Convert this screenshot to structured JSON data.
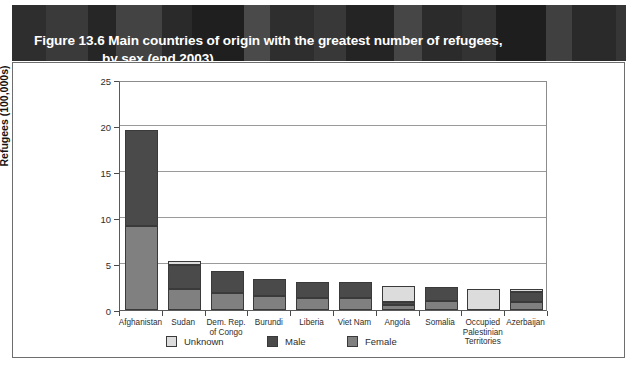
{
  "header": {
    "title_line1": "Figure 13.6 Main countries of origin with the greatest number of refugees,",
    "title_line2": "by sex (end 2003)",
    "band_color": "#2b2b2b"
  },
  "colors": {
    "unknown": "#dcdcdc",
    "male": "#4a4a4a",
    "female": "#808080",
    "gridline": "#9a9a9a",
    "axis": "#5a5a5a",
    "frame": "#6e6e6e"
  },
  "legend": {
    "position": "bottom",
    "items": [
      {
        "label": "Unknown",
        "color": "#dcdcdc"
      },
      {
        "label": "Male",
        "color": "#4a4a4a"
      },
      {
        "label": "Female",
        "color": "#808080"
      }
    ]
  },
  "chart_data": {
    "type": "bar",
    "subtype": "stacked",
    "title": "Figure 13.6 Main countries of origin with the greatest number of refugees, by sex (end 2003)",
    "xlabel": "",
    "ylabel": "Refugees (100,000s)",
    "ylim": [
      0,
      25
    ],
    "yticks": [
      0,
      5,
      10,
      15,
      20,
      25
    ],
    "ytick_labels": [
      "0",
      "5",
      "10",
      "15",
      "20",
      "25"
    ],
    "grid": true,
    "grid_axis": "y",
    "categories": [
      "Afghanistan",
      "Sudan",
      "Dem. Rep.\nof Congo",
      "Burundi",
      "Liberia",
      "Viet Nam",
      "Angola",
      "Somalia",
      "Occupied\nPalestinian\nTerritories",
      "Azerbaijan"
    ],
    "series": [
      {
        "name": "Female",
        "color": "#808080",
        "values": [
          9.1,
          2.3,
          1.8,
          1.5,
          1.3,
          1.3,
          0.5,
          1.0,
          0.0,
          0.9
        ]
      },
      {
        "name": "Male",
        "color": "#4a4a4a",
        "values": [
          10.5,
          2.6,
          2.4,
          1.9,
          1.8,
          1.8,
          0.4,
          1.5,
          0.0,
          1.1
        ]
      },
      {
        "name": "Unknown",
        "color": "#dcdcdc",
        "values": [
          0.0,
          0.4,
          0.0,
          0.0,
          0.0,
          0.0,
          1.7,
          0.0,
          2.3,
          0.3
        ]
      }
    ],
    "totals": [
      19.6,
      5.3,
      4.2,
      3.4,
      3.1,
      3.1,
      2.6,
      2.5,
      2.3,
      2.3
    ]
  }
}
